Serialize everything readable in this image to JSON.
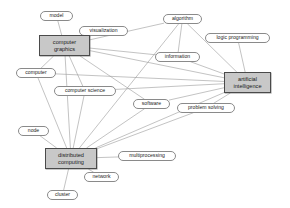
{
  "diagram": {
    "background_color": "#ffffff",
    "edge_color": "#9a9a9a",
    "concept_fill": "#c8c8c8",
    "concept_stroke": "#4a4a4a",
    "term_fill": "#ffffff",
    "term_stroke": "#8a8a8a",
    "text_color": "#1a1a1a"
  },
  "nodes": [
    {
      "id": "model",
      "label": "model",
      "kind": "term",
      "x": 40,
      "y": 11,
      "w": 33,
      "h": 10
    },
    {
      "id": "visualization",
      "label": "visualization",
      "kind": "term",
      "x": 79,
      "y": 26,
      "w": 49,
      "h": 10
    },
    {
      "id": "algorithm",
      "label": "algorithm",
      "kind": "term",
      "x": 163,
      "y": 14,
      "w": 39,
      "h": 10
    },
    {
      "id": "logic-programming",
      "label": "logic programming",
      "kind": "term",
      "x": 205,
      "y": 33,
      "w": 65,
      "h": 10
    },
    {
      "id": "information",
      "label": "information",
      "kind": "term",
      "x": 155,
      "y": 52,
      "w": 45,
      "h": 10
    },
    {
      "id": "computer",
      "label": "computer",
      "kind": "term",
      "x": 16,
      "y": 68,
      "w": 40,
      "h": 10
    },
    {
      "id": "computer-science",
      "label": "computer science",
      "kind": "term",
      "x": 54,
      "y": 86,
      "w": 62,
      "h": 10
    },
    {
      "id": "software",
      "label": "software",
      "kind": "term",
      "x": 133,
      "y": 99,
      "w": 37,
      "h": 10
    },
    {
      "id": "problem-solving",
      "label": "problem solving",
      "kind": "term",
      "x": 177,
      "y": 103,
      "w": 58,
      "h": 10
    },
    {
      "id": "node-left",
      "label": "node",
      "kind": "term",
      "x": 18,
      "y": 126,
      "w": 31,
      "h": 10
    },
    {
      "id": "multiprocessing",
      "label": "multiprocessing",
      "kind": "term",
      "x": 118,
      "y": 151,
      "w": 58,
      "h": 10
    },
    {
      "id": "network",
      "label": "network",
      "kind": "term",
      "x": 84,
      "y": 172,
      "w": 35,
      "h": 10
    },
    {
      "id": "cluster",
      "label": "cluster",
      "kind": "term",
      "x": 47,
      "y": 190,
      "w": 31,
      "h": 10
    },
    {
      "id": "computer-graphics",
      "label_line_1": "computer",
      "label_line_2": "graphics",
      "kind": "concept",
      "x": 39,
      "y": 35,
      "w": 51,
      "h": 21
    },
    {
      "id": "artificial-intelligence",
      "label_line_1": "artificial",
      "label_line_2": "intelligence",
      "kind": "concept",
      "x": 224,
      "y": 72,
      "w": 47,
      "h": 21
    },
    {
      "id": "distributed-computing",
      "label_line_1": "distributed",
      "label_line_2": "computing",
      "kind": "concept",
      "x": 45,
      "y": 148,
      "w": 52,
      "h": 21
    }
  ],
  "edges": [
    {
      "from": "model",
      "to": "computer-graphics"
    },
    {
      "from": "visualization",
      "to": "computer-graphics"
    },
    {
      "from": "algorithm",
      "to": "computer-graphics"
    },
    {
      "from": "algorithm",
      "to": "information"
    },
    {
      "from": "algorithm",
      "to": "artificial-intelligence"
    },
    {
      "from": "algorithm",
      "to": "distributed-computing"
    },
    {
      "from": "logic-programming",
      "to": "artificial-intelligence"
    },
    {
      "from": "information",
      "to": "computer-graphics"
    },
    {
      "from": "information",
      "to": "artificial-intelligence"
    },
    {
      "from": "computer",
      "to": "computer-graphics"
    },
    {
      "from": "computer",
      "to": "artificial-intelligence"
    },
    {
      "from": "computer",
      "to": "distributed-computing"
    },
    {
      "from": "computer-science",
      "to": "computer-graphics"
    },
    {
      "from": "computer-science",
      "to": "artificial-intelligence"
    },
    {
      "from": "computer-science",
      "to": "distributed-computing"
    },
    {
      "from": "software",
      "to": "computer-graphics"
    },
    {
      "from": "software",
      "to": "artificial-intelligence"
    },
    {
      "from": "software",
      "to": "distributed-computing"
    },
    {
      "from": "problem-solving",
      "to": "artificial-intelligence"
    },
    {
      "from": "problem-solving",
      "to": "distributed-computing"
    },
    {
      "from": "node-left",
      "to": "distributed-computing"
    },
    {
      "from": "multiprocessing",
      "to": "distributed-computing"
    },
    {
      "from": "network",
      "to": "distributed-computing"
    },
    {
      "from": "cluster",
      "to": "distributed-computing"
    },
    {
      "from": "computer-graphics",
      "to": "artificial-intelligence"
    },
    {
      "from": "computer-graphics",
      "to": "distributed-computing"
    },
    {
      "from": "distributed-computing",
      "to": "artificial-intelligence"
    }
  ]
}
